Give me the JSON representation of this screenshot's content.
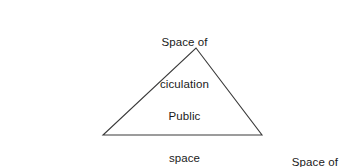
{
  "diagram": {
    "background_color": "#ffffff",
    "stroke_color": "#3a3a3a",
    "text_color": "#1a1a1a",
    "shape": "triangle",
    "vertices": {
      "apex": {
        "x": 196,
        "y": 48
      },
      "bottom_left": {
        "x": 103,
        "y": 135
      },
      "bottom_right": {
        "x": 262,
        "y": 135
      }
    },
    "labels": {
      "top": {
        "line1": "Space of",
        "line2": "ciculation"
      },
      "center": {
        "line1": "Public",
        "line2": "space"
      },
      "bottom_left": {
        "line1": "Space of use"
      },
      "bottom_right": {
        "line1": "Space of",
        "line2": "meeting"
      }
    }
  }
}
